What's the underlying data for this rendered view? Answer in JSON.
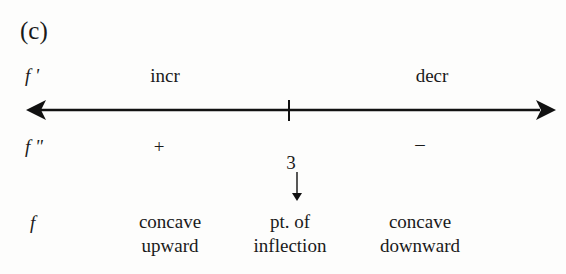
{
  "figure": {
    "part_label": "(c)",
    "rows": {
      "f_prime": {
        "label": "f '",
        "left_text": "incr",
        "right_text": "decr"
      },
      "f_double_prime": {
        "label": "f \"",
        "left_text": "+",
        "right_text": "–"
      },
      "f": {
        "label": "f",
        "left_text": [
          "concave",
          "upward"
        ],
        "middle_text": [
          "pt. of",
          "inflection"
        ],
        "right_text": [
          "concave",
          "downward"
        ]
      }
    },
    "axis": {
      "tick_value": "3",
      "arrows": "both-ends"
    }
  }
}
